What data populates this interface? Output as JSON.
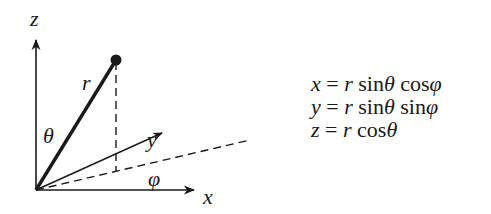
{
  "diagram": {
    "axes": {
      "z_label": "z",
      "x_label": "x",
      "y_label": "y"
    },
    "labels": {
      "radius": "r",
      "polar_angle": "θ",
      "azimuth_angle": "φ"
    },
    "colors": {
      "ink": "#1a1a1a",
      "background": "#ffffff"
    }
  },
  "equations": [
    {
      "text": "x = r sinθ cosφ"
    },
    {
      "text": "y = r sinθ sinφ"
    },
    {
      "text": "z = r cosθ"
    }
  ]
}
